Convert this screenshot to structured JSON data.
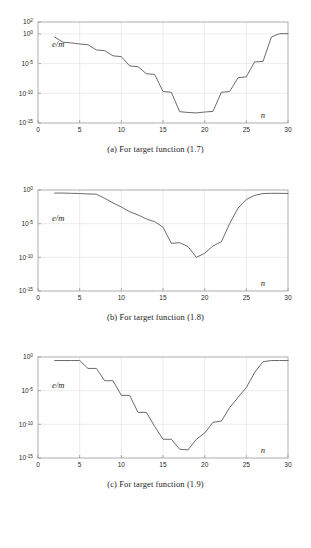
{
  "figure": {
    "background": "#ffffff",
    "line_color": "#5a5a5a",
    "axis_color": "#9a9a9a",
    "grid_color": "#d9d9d9",
    "text_color": "#1b1b1b"
  },
  "panels": [
    {
      "id": "panel-a",
      "caption": "(a) For target function (1.7)",
      "ylabel": "e/m",
      "xlabel": "n",
      "chart_data": {
        "type": "line",
        "title": "",
        "xlabel": "n",
        "ylabel": "e/m",
        "xlim": [
          0,
          30
        ],
        "ylim": [
          1e-15,
          100
        ],
        "yscale": "log",
        "grid": true,
        "legend": null,
        "xticks": [
          0,
          5,
          10,
          15,
          20,
          25,
          30
        ],
        "ytick_labels": [
          "10^2",
          "10^0",
          "10^-5",
          "10^-10",
          "10^-15"
        ],
        "yticks": [
          100,
          1,
          1e-05,
          1e-10,
          1e-15
        ],
        "x": [
          2,
          3,
          4,
          5,
          6,
          7,
          8,
          9,
          10,
          11,
          12,
          13,
          14,
          15,
          16,
          17,
          18,
          19,
          20,
          21,
          22,
          23,
          24,
          25,
          26,
          27,
          28,
          29,
          30
        ],
        "y": [
          0.3,
          0.04,
          0.03,
          0.02,
          0.015,
          0.002,
          0.0015,
          0.0002,
          0.00015,
          4e-06,
          3e-06,
          2e-07,
          1.5e-07,
          2e-10,
          1.5e-10,
          8e-14,
          6e-14,
          5e-14,
          7e-14,
          9e-14,
          1.5e-10,
          2e-10,
          4e-08,
          6e-08,
          2e-05,
          2.2e-05,
          0.3,
          1.1,
          1.1
        ]
      }
    },
    {
      "id": "panel-b",
      "caption": "(b) For target function (1.8)",
      "ylabel": "e/m",
      "xlabel": "n",
      "chart_data": {
        "type": "line",
        "title": "",
        "xlabel": "n",
        "ylabel": "e/m",
        "xlim": [
          0,
          30
        ],
        "ylim": [
          1e-15,
          1
        ],
        "yscale": "log",
        "grid": true,
        "legend": null,
        "xticks": [
          0,
          5,
          10,
          15,
          20,
          25,
          30
        ],
        "ytick_labels": [
          "10^0",
          "10^-5",
          "10^-10",
          "10^-15"
        ],
        "yticks": [
          1,
          1e-05,
          1e-10,
          1e-15
        ],
        "x": [
          2,
          3,
          4,
          5,
          6,
          7,
          8,
          9,
          10,
          11,
          12,
          13,
          14,
          15,
          16,
          17,
          18,
          19,
          20,
          21,
          22,
          23,
          24,
          25,
          26,
          27,
          28,
          29,
          30
        ],
        "y": [
          0.35,
          0.35,
          0.32,
          0.3,
          0.26,
          0.24,
          0.06,
          0.012,
          0.003,
          0.0006,
          0.0002,
          5e-05,
          2e-05,
          3e-06,
          1.2e-08,
          1.5e-08,
          4e-09,
          1e-10,
          4e-10,
          5e-09,
          2e-08,
          1e-05,
          0.002,
          0.04,
          0.16,
          0.3,
          0.32,
          0.32,
          0.3
        ]
      }
    },
    {
      "id": "panel-c",
      "caption": "(c) For target function (1.9)",
      "ylabel": "e/m",
      "xlabel": "n",
      "chart_data": {
        "type": "line",
        "title": "",
        "xlabel": "n",
        "ylabel": "e/m",
        "xlim": [
          0,
          30
        ],
        "ylim": [
          1e-15,
          1
        ],
        "yscale": "log",
        "grid": true,
        "legend": null,
        "xticks": [
          0,
          5,
          10,
          15,
          20,
          25,
          30
        ],
        "ytick_labels": [
          "10^0",
          "10^-5",
          "10^-10",
          "10^-15"
        ],
        "yticks": [
          1,
          1e-05,
          1e-10,
          1e-15
        ],
        "x": [
          2,
          3,
          4,
          5,
          6,
          7,
          8,
          9,
          10,
          11,
          12,
          13,
          14,
          15,
          16,
          17,
          18,
          19,
          20,
          21,
          22,
          23,
          24,
          25,
          26,
          27,
          28,
          29,
          30
        ],
        "y": [
          0.3,
          0.3,
          0.3,
          0.3,
          0.02,
          0.02,
          0.0003,
          0.0003,
          2e-06,
          2e-06,
          6e-09,
          6e-09,
          5e-11,
          6e-13,
          6e-13,
          2e-14,
          1.6e-14,
          6e-13,
          5e-12,
          2e-10,
          3e-10,
          3e-08,
          1e-06,
          3e-05,
          0.005,
          0.2,
          0.3,
          0.3,
          0.3
        ]
      }
    }
  ]
}
